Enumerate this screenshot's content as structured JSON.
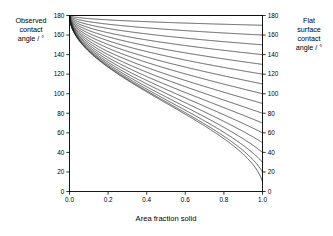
{
  "labels": {
    "left_axis_title": "Observed\ncontact\nangle / °",
    "right_axis_title": "Flat\nsurface\ncontact\nangle / °",
    "x_axis_title": "Area fraction solid"
  },
  "chart_data": {
    "type": "line",
    "title": "",
    "xlabel": "Area fraction solid",
    "ylabel": "Observed contact angle / °",
    "y2label": "Flat surface contact angle / °",
    "xlim": [
      0.0,
      1.0
    ],
    "ylim": [
      0,
      180
    ],
    "y2lim": [
      0,
      180
    ],
    "grid": false,
    "legend": "none",
    "xticks": [
      0.0,
      0.2,
      0.4,
      0.6,
      0.8,
      1.0
    ],
    "xticklabels": [
      "0.0",
      "0.2",
      "0.4",
      "0.6",
      "0.8",
      "1.0"
    ],
    "yticks": [
      0,
      20,
      40,
      60,
      80,
      100,
      120,
      140,
      160,
      180
    ],
    "yticklabels": [
      "0",
      "20",
      "40",
      "60",
      "80",
      "100",
      "120",
      "140",
      "160",
      "180"
    ],
    "y2ticks": [
      0,
      20,
      40,
      60,
      80,
      100,
      120,
      140,
      160,
      180
    ],
    "y2ticklabels": [
      "0",
      "20",
      "40",
      "60",
      "80",
      "100",
      "120",
      "140",
      "160",
      "180"
    ],
    "equation": "cos(theta_observed) = f*cos(theta_flat) - (1 - f)",
    "x": [
      0.0,
      0.05,
      0.1,
      0.15,
      0.2,
      0.25,
      0.3,
      0.35,
      0.4,
      0.45,
      0.5,
      0.55,
      0.6,
      0.65,
      0.7,
      0.75,
      0.8,
      0.85,
      0.9,
      0.95,
      1.0
    ],
    "series": [
      {
        "name": "180",
        "theta_flat": 180,
        "values": [
          180.0,
          180.0,
          180.0,
          180.0,
          180.0,
          180.0,
          180.0,
          180.0,
          180.0,
          180.0,
          180.0,
          180.0,
          180.0,
          180.0,
          180.0,
          180.0,
          180.0,
          180.0,
          180.0,
          180.0,
          180.0
        ]
      },
      {
        "name": "170",
        "theta_flat": 170,
        "values": [
          180.0,
          177.7,
          176.8,
          176.0,
          175.3,
          174.8,
          174.2,
          173.7,
          173.3,
          172.8,
          172.4,
          172.0,
          171.7,
          171.3,
          170.9,
          170.6,
          170.3,
          170.0,
          169.6,
          169.3,
          170.0
        ]
      },
      {
        "name": "160",
        "theta_flat": 160,
        "values": [
          180.0,
          175.4,
          173.6,
          172.2,
          171.0,
          169.9,
          168.9,
          168.0,
          167.1,
          166.3,
          165.5,
          164.8,
          164.1,
          163.4,
          162.7,
          162.1,
          161.4,
          160.8,
          160.2,
          159.6,
          160.0
        ]
      },
      {
        "name": "150",
        "theta_flat": 150,
        "values": [
          180.0,
          173.2,
          170.5,
          168.4,
          166.6,
          165.0,
          163.5,
          162.1,
          160.9,
          159.7,
          158.5,
          157.4,
          156.4,
          155.4,
          154.4,
          153.4,
          152.5,
          151.6,
          150.7,
          149.9,
          150.0
        ]
      },
      {
        "name": "140",
        "theta_flat": 140,
        "values": [
          180.0,
          171.0,
          167.4,
          164.7,
          162.3,
          160.2,
          158.3,
          156.5,
          154.8,
          153.2,
          151.7,
          150.3,
          148.9,
          147.5,
          146.2,
          145.0,
          143.7,
          142.5,
          141.3,
          140.2,
          140.0
        ]
      },
      {
        "name": "130",
        "theta_flat": 130,
        "values": [
          180.0,
          168.9,
          164.5,
          161.1,
          158.2,
          155.6,
          153.2,
          151.0,
          148.9,
          146.9,
          145.0,
          143.2,
          141.5,
          139.8,
          138.2,
          136.6,
          135.0,
          133.5,
          132.0,
          130.6,
          130.0
        ]
      },
      {
        "name": "120",
        "theta_flat": 120,
        "values": [
          180.0,
          166.9,
          161.6,
          157.6,
          154.2,
          151.1,
          148.3,
          145.7,
          143.2,
          140.9,
          138.6,
          136.5,
          134.4,
          132.4,
          130.5,
          128.6,
          126.7,
          124.9,
          123.1,
          121.4,
          120.0
        ]
      },
      {
        "name": "110",
        "theta_flat": 110,
        "values": [
          180.0,
          164.9,
          158.9,
          154.3,
          150.3,
          146.8,
          143.5,
          140.5,
          137.7,
          135.0,
          132.4,
          129.9,
          127.5,
          125.2,
          123.0,
          120.8,
          118.6,
          116.5,
          114.4,
          112.4,
          110.0
        ]
      },
      {
        "name": "100",
        "theta_flat": 100,
        "values": [
          180.0,
          163.0,
          156.2,
          151.0,
          146.5,
          142.5,
          138.8,
          135.4,
          132.2,
          129.2,
          126.3,
          123.5,
          120.8,
          118.1,
          115.6,
          113.1,
          110.6,
          108.2,
          105.8,
          103.4,
          100.0
        ]
      },
      {
        "name": "90",
        "theta_flat": 90,
        "values": [
          180.0,
          161.1,
          153.6,
          147.8,
          142.8,
          138.4,
          134.3,
          130.5,
          126.9,
          123.5,
          120.3,
          117.2,
          114.1,
          111.2,
          108.3,
          105.5,
          102.8,
          100.1,
          97.4,
          94.7,
          90.0
        ]
      },
      {
        "name": "80",
        "theta_flat": 80,
        "values": [
          180.0,
          159.3,
          151.0,
          144.7,
          139.2,
          134.3,
          129.8,
          125.6,
          121.7,
          118.0,
          114.4,
          111.0,
          107.6,
          104.4,
          101.2,
          98.1,
          95.1,
          92.1,
          89.1,
          86.1,
          80.0
        ]
      },
      {
        "name": "70",
        "theta_flat": 70,
        "values": [
          180.0,
          157.5,
          148.5,
          141.6,
          135.6,
          130.3,
          125.4,
          120.8,
          116.6,
          112.5,
          108.6,
          104.9,
          101.2,
          97.7,
          94.2,
          90.8,
          87.5,
          84.2,
          80.9,
          77.6,
          70.0
        ]
      },
      {
        "name": "60",
        "theta_flat": 60,
        "values": [
          180.0,
          155.7,
          146.0,
          138.6,
          132.1,
          126.3,
          121.0,
          116.1,
          111.5,
          107.1,
          102.9,
          98.8,
          94.8,
          91.0,
          87.2,
          83.5,
          79.8,
          76.1,
          72.4,
          68.6,
          60.0
        ]
      },
      {
        "name": "50",
        "theta_flat": 50,
        "values": [
          180.0,
          153.9,
          143.6,
          135.6,
          128.6,
          122.4,
          116.7,
          111.4,
          106.5,
          101.7,
          97.2,
          92.8,
          88.5,
          84.3,
          80.2,
          76.1,
          72.0,
          67.9,
          63.8,
          59.5,
          50.0
        ]
      },
      {
        "name": "40",
        "theta_flat": 40,
        "values": [
          180.0,
          152.2,
          141.2,
          132.7,
          125.3,
          118.7,
          112.6,
          106.9,
          101.6,
          96.5,
          91.6,
          86.9,
          82.2,
          77.6,
          73.1,
          68.6,
          64.1,
          59.5,
          54.8,
          49.9,
          40.0
        ]
      },
      {
        "name": "30",
        "theta_flat": 30,
        "values": [
          180.0,
          150.6,
          138.9,
          129.9,
          122.0,
          115.0,
          108.5,
          102.5,
          96.8,
          91.3,
          86.1,
          81.0,
          76.0,
          71.0,
          66.1,
          61.1,
          56.1,
          50.9,
          45.6,
          39.9,
          30.0
        ]
      },
      {
        "name": "20",
        "theta_flat": 20,
        "values": [
          180.0,
          149.0,
          136.7,
          127.2,
          118.9,
          111.5,
          104.7,
          98.3,
          92.3,
          86.5,
          80.9,
          75.4,
          70.0,
          64.7,
          59.3,
          53.9,
          48.3,
          42.5,
          36.4,
          29.7,
          20.0
        ]
      },
      {
        "name": "10",
        "theta_flat": 10,
        "values": [
          180.0,
          147.5,
          134.6,
          124.7,
          116.0,
          108.2,
          101.1,
          94.4,
          88.0,
          81.9,
          76.0,
          70.2,
          64.4,
          58.7,
          52.9,
          47.0,
          40.9,
          34.4,
          27.3,
          18.9,
          10.0
        ]
      }
    ],
    "series_count": 18,
    "line_color": "#1a1a1a",
    "background": "#ffffff"
  }
}
